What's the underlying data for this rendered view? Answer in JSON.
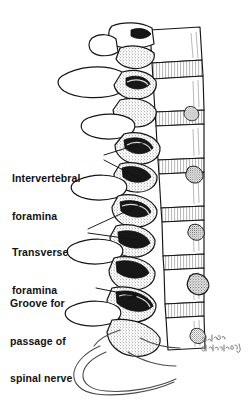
{
  "figure": {
    "medium": "pen-and-ink line drawing",
    "background_color": "#ffffff",
    "ink_color": "#111111"
  },
  "labels": [
    {
      "id": "intervertebral-foramina",
      "lines": [
        "Intervertebral",
        "foramina"
      ],
      "line1": "Intervertebral",
      "line2": "foramina",
      "leader": "forked-two-line"
    },
    {
      "id": "transverse-foramina",
      "lines": [
        "Transverse",
        "foramina"
      ],
      "line1": "Transverse",
      "line2": "foramina",
      "leader": "forked-two-line"
    },
    {
      "id": "groove-for-passage-of-spinal-nerve",
      "lines": [
        "Groove for",
        "passage of",
        "spinal nerve"
      ],
      "line1": "Groove for",
      "line2": "passage of",
      "line3": "spinal nerve",
      "leader": "single-arrow"
    }
  ],
  "signature": {
    "line1": "alfred",
    "line2": "Feinberg"
  }
}
